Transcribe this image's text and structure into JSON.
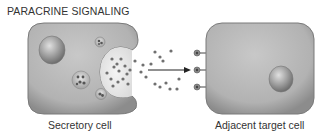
{
  "title": "PARACRINE SIGNALING",
  "labels": {
    "secretory": "Secretory cell",
    "target": "Adjacent target cell"
  },
  "colors": {
    "cell_fill": "#b4b4b4",
    "cell_edge": "#7a7a7a",
    "signal_molecule": "#6e6e6e",
    "background": "#ffffff"
  }
}
